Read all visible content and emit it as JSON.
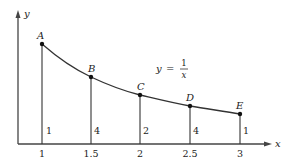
{
  "figure": {
    "function_label": {
      "lhs": "y",
      "equals": "=",
      "numerator": "1",
      "denominator": "x"
    },
    "axes": {
      "x_label": "x",
      "y_label": "y"
    },
    "x_ticks": [
      "1",
      "1.5",
      "2",
      "2.5",
      "3"
    ],
    "points": [
      {
        "label": "A",
        "x": 1.0,
        "weight": "1"
      },
      {
        "label": "B",
        "x": 1.5,
        "weight": "4"
      },
      {
        "label": "C",
        "x": 2.0,
        "weight": "2"
      },
      {
        "label": "D",
        "x": 2.5,
        "weight": "4"
      },
      {
        "label": "E",
        "x": 3.0,
        "weight": "1"
      }
    ],
    "colors": {
      "ink": "#222222",
      "axis": "#444444"
    }
  }
}
